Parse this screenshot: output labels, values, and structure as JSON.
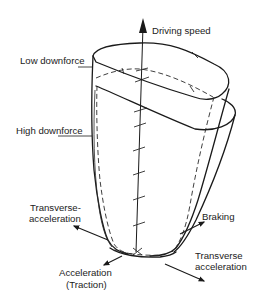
{
  "diagram": {
    "axes": {
      "vertical": "Driving speed",
      "transverse_left": [
        "Transverse-",
        "acceleration"
      ],
      "braking": "Braking",
      "transverse_right": [
        "Transverse",
        "acceleration"
      ],
      "acceleration": [
        "Acceleration",
        "(Traction)"
      ]
    },
    "envelopes": {
      "low_downforce": "Low downforce",
      "high_downforce": "High downforce"
    },
    "colors": {
      "line": "#1a1a1a",
      "background": "#ffffff"
    }
  }
}
